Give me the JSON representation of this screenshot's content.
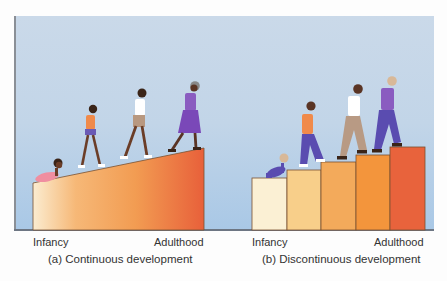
{
  "figure": {
    "panel_a": {
      "caption": "(a) Continuous development",
      "start_label": "Infancy",
      "end_label": "Adulthood",
      "shape": "ramp",
      "figures": [
        "crawling-baby",
        "girl-walking",
        "boy-walking",
        "older-woman-walking"
      ]
    },
    "panel_b": {
      "caption": "(b) Discontinuous development",
      "start_label": "Infancy",
      "end_label": "Adulthood",
      "shape": "staircase",
      "steps": 5,
      "step_colors": [
        "#fbf0d4",
        "#f8cf8a",
        "#f3aa5b",
        "#f3953c",
        "#e8633c"
      ],
      "figures": [
        "crawling-baby",
        "boy-climbing",
        "man-climbing",
        "older-man-climbing"
      ]
    },
    "colors": {
      "sky_top": "#cad9e9",
      "sky_bottom": "#a9c8e6",
      "ramp_start": "#fbecd0",
      "ramp_end": "#e8603a"
    }
  }
}
